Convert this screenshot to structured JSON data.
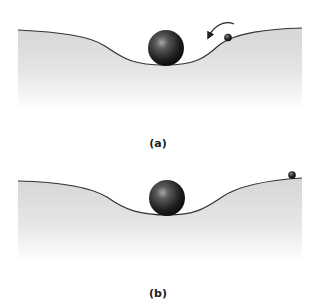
{
  "panels": [
    {
      "id": "a",
      "label": "(a)",
      "description": "Large ball resting at bottom of valley; small ball on right slope with curved arrow pointing down-left toward valley",
      "large_ball": "in-valley",
      "small_ball": "on-right-slope",
      "arrow": "curved, pointing toward valley"
    },
    {
      "id": "b",
      "label": "(b)",
      "description": "Large ball resting at bottom of valley; small ball at top of right plateau",
      "large_ball": "in-valley",
      "small_ball": "on-right-plateau"
    }
  ],
  "colors": {
    "ground_top": "#d8d8d8",
    "ground_bottom": "#ffffff",
    "curve": "#333333",
    "ball_dark": "#111111",
    "ball_highlight": "#9a9a9a"
  }
}
